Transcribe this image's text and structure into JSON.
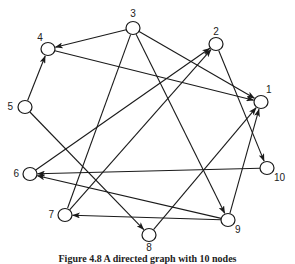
{
  "diagram": {
    "type": "directed-graph",
    "colors": {
      "stroke": "#1a1a1a",
      "node_fill": "#ffffff",
      "background": "#ffffff"
    },
    "nodes": [
      {
        "id": "1",
        "label": "1",
        "x": 261,
        "y": 102,
        "lx": 266,
        "ly": 93,
        "anchor": "start"
      },
      {
        "id": "2",
        "label": "2",
        "x": 216,
        "y": 44,
        "lx": 216,
        "ly": 35,
        "anchor": "middle"
      },
      {
        "id": "3",
        "label": "3",
        "x": 133,
        "y": 28,
        "lx": 133,
        "ly": 17,
        "anchor": "middle"
      },
      {
        "id": "4",
        "label": "4",
        "x": 48,
        "y": 49,
        "lx": 40,
        "ly": 41,
        "anchor": "middle"
      },
      {
        "id": "5",
        "label": "5",
        "x": 25,
        "y": 107,
        "lx": 13,
        "ly": 110,
        "anchor": "end"
      },
      {
        "id": "6",
        "label": "6",
        "x": 30,
        "y": 174,
        "lx": 19,
        "ly": 177,
        "anchor": "end"
      },
      {
        "id": "7",
        "label": "7",
        "x": 65,
        "y": 215,
        "lx": 54,
        "ly": 218,
        "anchor": "end"
      },
      {
        "id": "8",
        "label": "8",
        "x": 149,
        "y": 235,
        "lx": 149,
        "ly": 251,
        "anchor": "middle"
      },
      {
        "id": "9",
        "label": "9",
        "x": 228,
        "y": 220,
        "lx": 235,
        "ly": 233,
        "anchor": "start"
      },
      {
        "id": "10",
        "label": "10",
        "x": 267,
        "y": 168,
        "lx": 274,
        "ly": 181,
        "anchor": "start"
      }
    ],
    "edges": [
      {
        "from": "3",
        "to": "4",
        "arrow": true
      },
      {
        "from": "3",
        "to": "1",
        "arrow": true
      },
      {
        "from": "3",
        "to": "9",
        "arrow": true
      },
      {
        "from": "3",
        "to": "7",
        "arrow": false
      },
      {
        "from": "4",
        "to": "1",
        "arrow": true
      },
      {
        "from": "5",
        "to": "4",
        "arrow": true
      },
      {
        "from": "5",
        "to": "8",
        "arrow": true
      },
      {
        "from": "6",
        "to": "2",
        "arrow": true
      },
      {
        "from": "7",
        "to": "2",
        "arrow": true
      },
      {
        "from": "2",
        "to": "10",
        "arrow": true
      },
      {
        "from": "10",
        "to": "6",
        "arrow": true
      },
      {
        "from": "9",
        "to": "6",
        "arrow": true
      },
      {
        "from": "9",
        "to": "7",
        "arrow": true
      },
      {
        "from": "9",
        "to": "1",
        "arrow": true
      },
      {
        "from": "8",
        "to": "1",
        "arrow": true
      }
    ]
  },
  "caption": "Figure 4.8  A directed graph with 10 nodes"
}
